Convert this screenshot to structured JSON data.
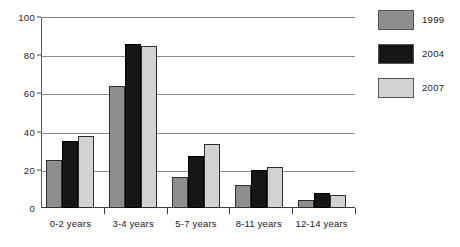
{
  "chart_data": {
    "type": "bar",
    "title": "",
    "xlabel": "",
    "ylabel": "",
    "ylim": [
      0,
      100
    ],
    "yticks": [
      0,
      20,
      40,
      60,
      80,
      100
    ],
    "grid": true,
    "legend_position": "right",
    "categories": [
      "0-2 years",
      "3-4 years",
      "5-7 years",
      "8-11 years",
      "12-14 years"
    ],
    "series": [
      {
        "name": "1999",
        "color": "#8e8e8e",
        "values": [
          25,
          64,
          16,
          12,
          4
        ]
      },
      {
        "name": "2004",
        "color": "#161616",
        "values": [
          35,
          86,
          27,
          20,
          8
        ]
      },
      {
        "name": "2007",
        "color": "#d2d2d2",
        "values": [
          37.5,
          85,
          33.5,
          21.5,
          7
        ]
      }
    ]
  },
  "axis": {
    "tick_labels": [
      "0",
      "20",
      "40",
      "60",
      "80",
      "100"
    ]
  },
  "legend": {
    "items": [
      {
        "label": "1999"
      },
      {
        "label": "2004"
      },
      {
        "label": "2007"
      }
    ]
  }
}
